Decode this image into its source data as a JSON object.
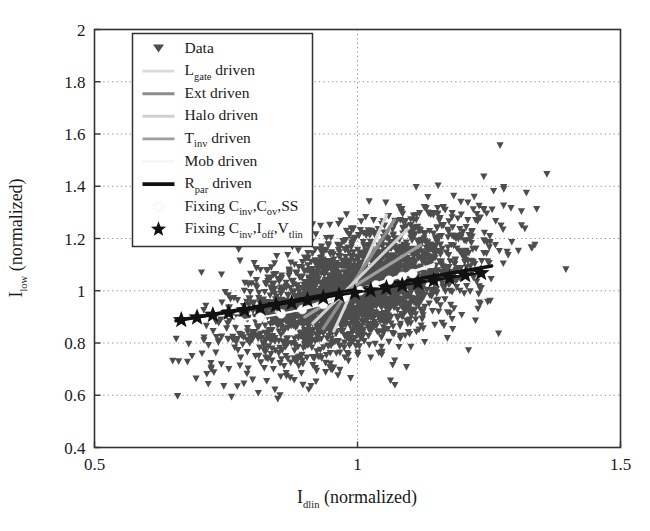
{
  "chart_data": {
    "type": "scatter",
    "title": "",
    "xlabel": "I_dlin (normalized)",
    "ylabel": "I_low (normalized)",
    "xlabel_parts": {
      "main": "I",
      "sub": "dlin",
      "tail": " (normalized)"
    },
    "ylabel_parts": {
      "main": "I",
      "sub": "low",
      "tail": " (normalized)"
    },
    "xlim": [
      0.5,
      1.5
    ],
    "ylim": [
      0.4,
      2.0
    ],
    "xticks": [
      "0.5",
      "1",
      "1.5"
    ],
    "xtick_values": [
      0.5,
      1.0,
      1.5
    ],
    "yticks": [
      "0.4",
      "0.6",
      "0.8",
      "1",
      "1.2",
      "1.4",
      "1.6",
      "1.8",
      "2"
    ],
    "ytick_values": [
      0.4,
      0.6,
      0.8,
      1.0,
      1.2,
      1.4,
      1.6,
      1.8,
      2.0
    ],
    "grid": true,
    "grid_style": "dotted",
    "legend_position": "upper-left-inside",
    "marker_color": "#4d4d4d",
    "scatter": {
      "name": "Data",
      "marker": "triangle-down",
      "n_points": 2400,
      "center": [
        1.0,
        1.0
      ],
      "x_range": [
        0.62,
        1.45
      ],
      "y_range": [
        0.55,
        1.62
      ],
      "correlation": 0.55,
      "x_sigma": 0.115,
      "y_sigma": 0.135
    },
    "series": [
      {
        "name": "L_gate driven",
        "label_parts": {
          "main": "L",
          "sub": "gate",
          "tail": " driven"
        },
        "color": "#d9d9d9",
        "width": 3.0,
        "marker": "none",
        "x": [
          0.955,
          1.055
        ],
        "y": [
          0.845,
          1.29
        ]
      },
      {
        "name": "Ext driven",
        "label_parts": {
          "main": "Ext driven",
          "sub": "",
          "tail": ""
        },
        "color": "#8c8c8c",
        "width": 3.4,
        "marker": "none",
        "x": [
          0.935,
          1.07
        ],
        "y": [
          0.855,
          1.27
        ]
      },
      {
        "name": "Halo driven",
        "label_parts": {
          "main": "Halo driven",
          "sub": "",
          "tail": ""
        },
        "color": "#cfcfcf",
        "width": 3.0,
        "marker": "none",
        "x": [
          0.915,
          1.095
        ],
        "y": [
          0.875,
          1.235
        ]
      },
      {
        "name": "T_inv driven",
        "label_parts": {
          "main": "T",
          "sub": "inv",
          "tail": " driven"
        },
        "color": "#9e9e9e",
        "width": 3.2,
        "marker": "none",
        "x": [
          0.9,
          1.12
        ],
        "y": [
          0.9,
          1.175
        ]
      },
      {
        "name": "Mob driven",
        "label_parts": {
          "main": "Mob driven",
          "sub": "",
          "tail": ""
        },
        "color": "#f2f2f2",
        "width": 3.0,
        "marker": "none",
        "x": [
          0.885,
          1.145
        ],
        "y": [
          0.925,
          1.1
        ]
      },
      {
        "name": "R_par driven",
        "label_parts": {
          "main": "R",
          "sub": "par",
          "tail": " driven"
        },
        "color": "#111111",
        "width": 3.6,
        "marker": "none",
        "x": [
          0.655,
          1.255
        ],
        "y": [
          0.885,
          1.095
        ]
      },
      {
        "name": "Fixing C_inv,C_ov,SS",
        "label_parts": {
          "main": "Fixing C",
          "sub": "inv",
          "tail": ",C",
          "sub2": "ov",
          "tail2": ",SS"
        },
        "color": "#fdfdfd",
        "width": 2.0,
        "marker": "circle",
        "marker_size": 9,
        "x": [
          0.775,
          0.815,
          0.855,
          0.895,
          0.935,
          0.975,
          1.005,
          1.035,
          1.06,
          1.085,
          1.105
        ],
        "y": [
          0.885,
          0.898,
          0.912,
          0.928,
          0.948,
          0.975,
          1.0,
          1.022,
          1.04,
          1.055,
          1.066
        ]
      },
      {
        "name": "Fixing C_inv,I_off,V_tlin",
        "label_parts": {
          "main": "Fixing C",
          "sub": "inv",
          "tail": ",I",
          "sub2": "off",
          "tail2": ",V",
          "sub3": "tlin"
        },
        "color": "#111111",
        "width": 2.2,
        "marker": "star",
        "marker_size": 9,
        "x": [
          0.665,
          0.695,
          0.725,
          0.755,
          0.785,
          0.815,
          0.845,
          0.875,
          0.905,
          0.935,
          0.965,
          0.995,
          1.025,
          1.055,
          1.085,
          1.115,
          1.145,
          1.175,
          1.205,
          1.235
        ],
        "y": [
          0.888,
          0.898,
          0.907,
          0.916,
          0.926,
          0.935,
          0.945,
          0.954,
          0.964,
          0.973,
          0.983,
          0.992,
          1.002,
          1.011,
          1.021,
          1.03,
          1.04,
          1.049,
          1.059,
          1.068
        ]
      }
    ],
    "legend_entries": [
      {
        "label": "Data",
        "type": "marker",
        "marker": "triangle-down",
        "color": "#4d4d4d"
      },
      {
        "label": "L_gate driven",
        "type": "line",
        "color": "#d9d9d9"
      },
      {
        "label": "Ext driven",
        "type": "line",
        "color": "#8c8c8c"
      },
      {
        "label": "Halo driven",
        "type": "line",
        "color": "#cfcfcf"
      },
      {
        "label": "T_inv driven",
        "type": "line",
        "color": "#9e9e9e"
      },
      {
        "label": "Mob driven",
        "type": "line",
        "color": "#f7f7f7"
      },
      {
        "label": "R_par driven",
        "type": "line",
        "color": "#111111"
      },
      {
        "label": "Fixing C_inv,C_ov,SS",
        "type": "marker",
        "marker": "circle",
        "color": "#fdfdfd"
      },
      {
        "label": "Fixing C_inv,I_off,V_tlin",
        "type": "marker",
        "marker": "star",
        "color": "#111111"
      }
    ]
  },
  "axes": {
    "frame_color": "#333333",
    "background": "#ffffff"
  }
}
